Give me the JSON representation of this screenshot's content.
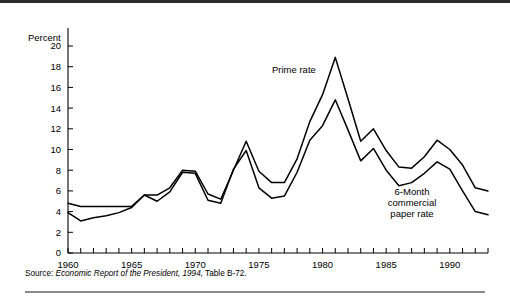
{
  "figure": {
    "percent_axis_title": "Percent",
    "source_lead": "Source:",
    "source_italic": "Economic Report of the President, 1994,",
    "source_tail": "Table B-72."
  },
  "annotations": {
    "prime_label": "Prime rate",
    "cp_line1": "6-Month",
    "cp_line2": "commercial",
    "cp_line3": "paper rate"
  },
  "chart_data": {
    "type": "line",
    "title": "",
    "xlabel": "",
    "ylabel": "Percent",
    "xlim": [
      1960,
      1993
    ],
    "ylim": [
      0,
      20
    ],
    "ytick_step": 2,
    "grid": false,
    "legend": "inline-annotations",
    "x_tick_labels": [
      "1960",
      "1965",
      "1970",
      "1975",
      "1980",
      "1985",
      "1990"
    ],
    "x_tick_label_years": [
      1960,
      1965,
      1970,
      1975,
      1980,
      1985,
      1990
    ],
    "y_tick_labels": [
      "0",
      "2",
      "4",
      "6",
      "8",
      "10",
      "12",
      "14",
      "16",
      "18",
      "20"
    ],
    "y_tick_values": [
      0,
      2,
      4,
      6,
      8,
      10,
      12,
      14,
      16,
      18,
      20
    ],
    "x": [
      1960,
      1961,
      1962,
      1963,
      1964,
      1965,
      1966,
      1967,
      1968,
      1969,
      1970,
      1971,
      1972,
      1973,
      1974,
      1975,
      1976,
      1977,
      1978,
      1979,
      1980,
      1981,
      1982,
      1983,
      1984,
      1985,
      1986,
      1987,
      1988,
      1989,
      1990,
      1991,
      1992,
      1993
    ],
    "series": [
      {
        "name": "Prime rate",
        "values": [
          4.8,
          4.5,
          4.5,
          4.5,
          4.5,
          4.5,
          5.6,
          5.6,
          6.3,
          8.0,
          7.9,
          5.7,
          5.2,
          8.0,
          10.8,
          7.9,
          6.8,
          6.8,
          9.1,
          12.7,
          15.3,
          18.9,
          14.9,
          10.8,
          12.0,
          9.9,
          8.3,
          8.2,
          9.3,
          10.9,
          10.0,
          8.5,
          6.3,
          6.0
        ]
      },
      {
        "name": "6-Month commercial paper rate",
        "values": [
          3.9,
          3.1,
          3.4,
          3.6,
          3.9,
          4.4,
          5.6,
          5.0,
          5.9,
          7.8,
          7.7,
          5.1,
          4.8,
          8.1,
          9.9,
          6.3,
          5.3,
          5.5,
          7.8,
          10.9,
          12.3,
          14.8,
          11.9,
          8.9,
          10.1,
          8.0,
          6.5,
          6.8,
          7.7,
          8.8,
          8.1,
          6.0,
          4.0,
          3.7
        ]
      }
    ]
  }
}
